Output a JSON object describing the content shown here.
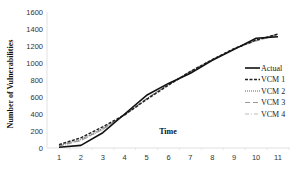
{
  "chart_data": {
    "type": "line",
    "title": "",
    "xlabel": "Time",
    "ylabel": "Number of Vulnerabilities",
    "x": [
      1,
      2,
      3,
      4,
      5,
      6,
      7,
      8,
      9,
      10,
      11
    ],
    "ylim": [
      0,
      1600
    ],
    "yticks": [
      0,
      200,
      400,
      600,
      800,
      1000,
      1200,
      1400,
      1600
    ],
    "xticks": [
      "1",
      "2",
      "3",
      "4",
      "5",
      "6",
      "7",
      "8",
      "9",
      "10",
      "11"
    ],
    "grid": false,
    "legend_position": "right-inside",
    "series": [
      {
        "name": "Actual",
        "style": "solid",
        "color": "#111111",
        "values": [
          10,
          30,
          180,
          400,
          620,
          760,
          880,
          1030,
          1160,
          1290,
          1310
        ]
      },
      {
        "name": "VCM 1",
        "style": "dashed-bold",
        "color": "#222222",
        "values": [
          40,
          120,
          250,
          390,
          570,
          740,
          900,
          1040,
          1170,
          1270,
          1340
        ]
      },
      {
        "name": "VCM 2",
        "style": "dotted",
        "color": "#555555",
        "values": [
          30,
          100,
          230,
          390,
          580,
          750,
          900,
          1040,
          1170,
          1270,
          1340
        ]
      },
      {
        "name": "VCM 3",
        "style": "long-dash",
        "color": "#999999",
        "values": [
          25,
          90,
          220,
          390,
          580,
          750,
          900,
          1040,
          1170,
          1260,
          1330
        ]
      },
      {
        "name": "VCM 4",
        "style": "dash-dot",
        "color": "#bbbbbb",
        "values": [
          20,
          85,
          215,
          385,
          575,
          745,
          895,
          1035,
          1165,
          1260,
          1330
        ]
      }
    ]
  },
  "labels": {
    "ylabel": "Number of Vulnerabilities",
    "xlabel": "Time"
  }
}
